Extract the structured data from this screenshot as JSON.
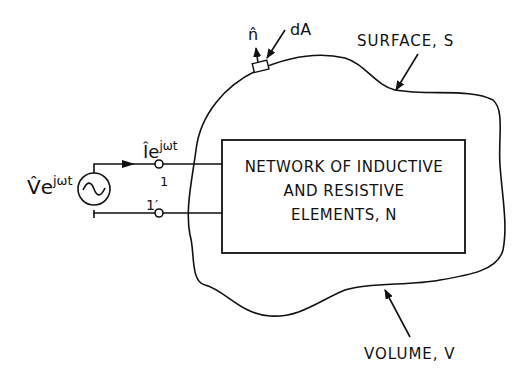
{
  "diagram": {
    "source": {
      "label_main": "V̂e",
      "label_sup": "jωt",
      "symbol": "sine-wave"
    },
    "current": {
      "label_main": "Îe",
      "label_sup": "jωt"
    },
    "terminals": {
      "top": "1",
      "bottom": "1′"
    },
    "network_box": {
      "lines": [
        "NETWORK OF INDUCTIVE",
        "AND RESISTIVE",
        "ELEMENTS, N"
      ]
    },
    "surface_element": {
      "normal_label": "n̂",
      "area_label": "dA"
    },
    "surface_label": "SURFACE, S",
    "volume_label": "VOLUME, V",
    "colors": {
      "ink": "#111111",
      "background": "#ffffff"
    }
  }
}
